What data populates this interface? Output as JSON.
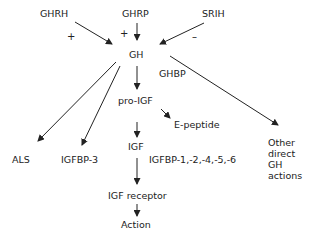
{
  "diagram": {
    "nodes": {
      "ghrh": "GHRH",
      "ghrp": "GHRP",
      "srih": "SRIH",
      "gh": "GH",
      "ghbp": "GHBP",
      "pro_igf": "pro-IGF",
      "e_peptide": "E-peptide",
      "igf": "IGF",
      "als": "ALS",
      "igfbp3": "IGFBP-3",
      "igfbp_others": "IGFBP-1,-2,-4,-5,-6",
      "igf_receptor": "IGF receptor",
      "action": "Action",
      "other_gh_actions": "Other direct GH actions"
    },
    "signs": {
      "ghrh_sign": "+",
      "ghrp_sign": "+",
      "srih_sign": "–"
    },
    "edges": [
      {
        "from": "GHRH",
        "to": "GH",
        "sign": "+"
      },
      {
        "from": "GHRP",
        "to": "GH",
        "sign": "+"
      },
      {
        "from": "SRIH",
        "to": "GH",
        "sign": "-"
      },
      {
        "from": "GH",
        "to": "pro-IGF"
      },
      {
        "from": "GH",
        "to": "ALS"
      },
      {
        "from": "GH",
        "to": "IGFBP-3"
      },
      {
        "from": "GH",
        "to": "Other direct GH actions",
        "label": "GHBP"
      },
      {
        "from": "pro-IGF",
        "to": "E-peptide"
      },
      {
        "from": "pro-IGF",
        "to": "IGF"
      },
      {
        "from": "IGF",
        "to": "IGF receptor",
        "label": "IGFBP-1,-2,-4,-5,-6"
      },
      {
        "from": "IGF receptor",
        "to": "Action"
      }
    ],
    "colors": {
      "line": "#222222",
      "text": "#222222",
      "background": "#ffffff"
    }
  }
}
